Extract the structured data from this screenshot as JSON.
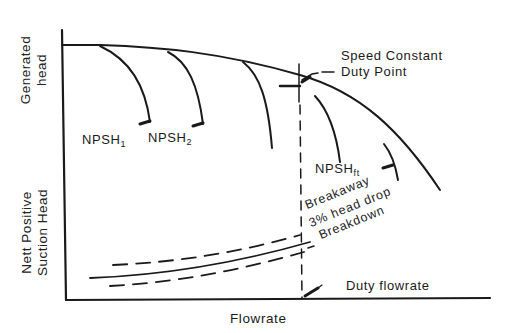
{
  "diagram": {
    "axes": {
      "x_label": "Flowrate",
      "y_label_top_line1": "Generated",
      "y_label_top_line2": "head",
      "y_label_bottom_line1": "Nett Positive",
      "y_label_bottom_line2": "Suction Head"
    },
    "upper_panel": {
      "annotation_line1": "Speed Constant",
      "annotation_line2": "Duty Point",
      "curves": [
        {
          "label": "NPSH",
          "subscript": "1"
        },
        {
          "label": "NPSH",
          "subscript": "2"
        },
        {
          "label": "",
          "subscript": ""
        },
        {
          "label": "",
          "subscript": ""
        },
        {
          "label": "NPSH",
          "subscript": "ft"
        }
      ]
    },
    "lower_panel": {
      "curves": [
        {
          "label": "Breakaway",
          "style": "dashed"
        },
        {
          "label": "3% head drop",
          "style": "solid"
        },
        {
          "label": "Breakdown",
          "style": "dashed"
        }
      ],
      "duty_label": "Duty flowrate"
    },
    "colors": {
      "ink": "#1a1a1a",
      "background": "#ffffff"
    }
  }
}
